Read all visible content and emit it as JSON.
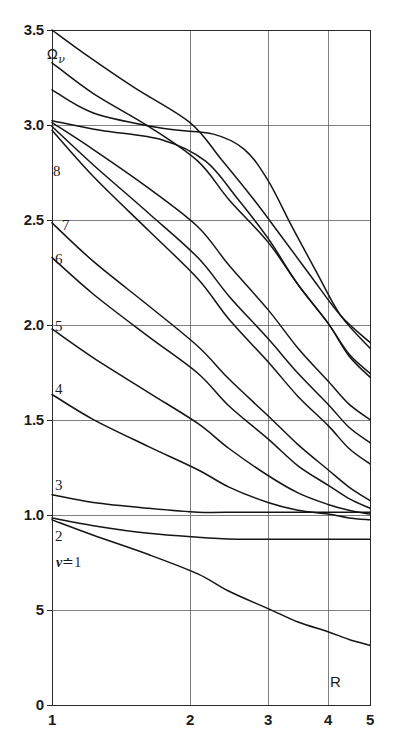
{
  "figure": {
    "name": "omega-nu-vs-R-chart",
    "background": "#ffffff",
    "ink_color": "#1a1a1a"
  },
  "chart_data": {
    "type": "line",
    "title": "",
    "subtitle": "",
    "xlabel": "R",
    "ylabel": "Ων",
    "xlim": [
      1,
      5
    ],
    "ylim": [
      0,
      3.5
    ],
    "grid": true,
    "grid_style": "solid thin rules at labeled ticks",
    "legend": "inline curve labels at left edge",
    "legend_position": "inline-left",
    "x_axis_scale": "nonlinear (compressed toward large R)",
    "x_ticks": [
      1,
      2,
      3,
      4,
      5
    ],
    "x_tick_labels": [
      "1",
      "2",
      "3",
      "4",
      "5"
    ],
    "x_tick_px": [
      52,
      190,
      268,
      328,
      370
    ],
    "y_ticks": [
      0,
      0.5,
      1.0,
      1.5,
      2.0,
      2.5,
      3.0,
      3.5
    ],
    "y_tick_labels": [
      "0",
      "5",
      "1.0",
      "1.5",
      "2.0",
      "2.5",
      "3.0",
      "3.5"
    ],
    "y_tick_px": [
      705,
      610,
      515,
      420,
      325,
      220,
      125,
      30
    ],
    "annotations": [
      {
        "text": "Ων",
        "x_px": 47,
        "y_px": 55,
        "kind": "y-axis-symbol"
      },
      {
        "text": "R",
        "x_px": 330,
        "y_px": 682,
        "kind": "x-axis-symbol"
      }
    ],
    "series": [
      {
        "name": "nu = 1",
        "label": "ν ≐ 1",
        "label_x_px": 57,
        "label_y_px": 564,
        "points": [
          [
            1,
            0.96
          ],
          [
            1.3,
            0.88
          ],
          [
            1.7,
            0.78
          ],
          [
            2.1,
            0.68
          ],
          [
            2.5,
            0.59
          ],
          [
            3.0,
            0.5
          ],
          [
            3.5,
            0.43
          ],
          [
            4.0,
            0.38
          ],
          [
            4.5,
            0.34
          ],
          [
            5.0,
            0.31
          ]
        ]
      },
      {
        "name": "nu = 2",
        "label": "2",
        "label_x_px": 57,
        "label_y_px": 537,
        "points": [
          [
            1,
            0.97
          ],
          [
            1.3,
            0.93
          ],
          [
            1.7,
            0.89
          ],
          [
            2.1,
            0.87
          ],
          [
            2.6,
            0.86
          ],
          [
            3.0,
            0.86
          ],
          [
            3.5,
            0.86
          ],
          [
            4.0,
            0.86
          ],
          [
            4.5,
            0.86
          ],
          [
            5.0,
            0.86
          ]
        ]
      },
      {
        "name": "nu = 3",
        "label": "3",
        "label_x_px": 57,
        "label_y_px": 486,
        "points": [
          [
            1,
            1.09
          ],
          [
            1.3,
            1.05
          ],
          [
            1.7,
            1.02
          ],
          [
            2.1,
            1.0
          ],
          [
            2.6,
            1.0
          ],
          [
            3.0,
            1.0
          ],
          [
            3.5,
            1.0
          ],
          [
            4.0,
            1.0
          ],
          [
            4.5,
            1.0
          ],
          [
            5.0,
            1.0
          ]
        ]
      },
      {
        "name": "nu = 4",
        "label": "4",
        "label_x_px": 57,
        "label_y_px": 390,
        "points": [
          [
            1,
            1.61
          ],
          [
            1.3,
            1.48
          ],
          [
            1.7,
            1.34
          ],
          [
            2.1,
            1.22
          ],
          [
            2.5,
            1.13
          ],
          [
            3.0,
            1.05
          ],
          [
            3.5,
            1.01
          ],
          [
            4.0,
            0.99
          ],
          [
            4.5,
            0.97
          ],
          [
            5.0,
            0.96
          ]
        ]
      },
      {
        "name": "nu = 5",
        "label": "5",
        "label_x_px": 57,
        "label_y_px": 327,
        "points": [
          [
            1,
            1.95
          ],
          [
            1.3,
            1.8
          ],
          [
            1.7,
            1.62
          ],
          [
            2.1,
            1.46
          ],
          [
            2.5,
            1.33
          ],
          [
            3.0,
            1.19
          ],
          [
            3.5,
            1.1
          ],
          [
            4.0,
            1.04
          ],
          [
            4.5,
            1.01
          ],
          [
            5.0,
            0.99
          ]
        ]
      },
      {
        "name": "nu = 6",
        "label": "6",
        "label_x_px": 57,
        "label_y_px": 260,
        "points": [
          [
            1,
            2.32
          ],
          [
            1.3,
            2.13
          ],
          [
            1.7,
            1.91
          ],
          [
            2.1,
            1.72
          ],
          [
            2.5,
            1.55
          ],
          [
            3.0,
            1.38
          ],
          [
            3.5,
            1.24
          ],
          [
            4.0,
            1.14
          ],
          [
            4.5,
            1.07
          ],
          [
            5.0,
            1.02
          ]
        ]
      },
      {
        "name": "nu = 7",
        "label": "7",
        "label_x_px": 62,
        "label_y_px": 226,
        "points": [
          [
            1,
            2.5
          ],
          [
            1.3,
            2.3
          ],
          [
            1.7,
            2.07
          ],
          [
            2.1,
            1.86
          ],
          [
            2.5,
            1.69
          ],
          [
            3.0,
            1.5
          ],
          [
            3.5,
            1.35
          ],
          [
            4.0,
            1.22
          ],
          [
            4.5,
            1.13
          ],
          [
            5.0,
            1.06
          ]
        ]
      },
      {
        "name": "nu = 8",
        "label": "8",
        "label_x_px": 57,
        "label_y_px": 172,
        "points": [
          [
            1,
            2.98
          ],
          [
            1.3,
            2.74
          ],
          [
            1.7,
            2.46
          ],
          [
            2.1,
            2.21
          ],
          [
            2.5,
            2.0
          ],
          [
            3.0,
            1.78
          ],
          [
            3.5,
            1.6
          ],
          [
            4.0,
            1.45
          ],
          [
            4.5,
            1.33
          ],
          [
            5.0,
            1.25
          ]
        ]
      },
      {
        "name": "nu = 9",
        "label": "",
        "points": [
          [
            1,
            3.0
          ],
          [
            1.3,
            2.8
          ],
          [
            1.7,
            2.55
          ],
          [
            2.1,
            2.32
          ],
          [
            2.5,
            2.12
          ],
          [
            3.0,
            1.9
          ],
          [
            3.5,
            1.72
          ],
          [
            4.0,
            1.56
          ],
          [
            4.5,
            1.44
          ],
          [
            5.0,
            1.36
          ]
        ]
      },
      {
        "name": "nu = 10",
        "label": "",
        "points": [
          [
            1,
            3.02
          ],
          [
            1.3,
            2.88
          ],
          [
            1.7,
            2.68
          ],
          [
            2.1,
            2.48
          ],
          [
            2.5,
            2.28
          ],
          [
            3.0,
            2.05
          ],
          [
            3.5,
            1.85
          ],
          [
            4.0,
            1.68
          ],
          [
            4.5,
            1.56
          ],
          [
            5.0,
            1.48
          ]
        ]
      },
      {
        "name": "nu = 11",
        "label": "",
        "points": [
          [
            1,
            3.03
          ],
          [
            1.35,
            2.98
          ],
          [
            1.8,
            2.93
          ],
          [
            2.2,
            2.82
          ],
          [
            2.6,
            2.63
          ],
          [
            3.0,
            2.42
          ],
          [
            3.5,
            2.18
          ],
          [
            4.0,
            1.98
          ],
          [
            4.5,
            1.82
          ],
          [
            5.0,
            1.72
          ]
        ]
      },
      {
        "name": "nu = 12",
        "label": "",
        "points": [
          [
            1,
            3.19
          ],
          [
            1.3,
            3.07
          ],
          [
            1.8,
            2.99
          ],
          [
            2.3,
            2.96
          ],
          [
            2.7,
            2.88
          ],
          [
            3.0,
            2.72
          ],
          [
            3.4,
            2.48
          ],
          [
            3.8,
            2.25
          ],
          [
            4.3,
            2.02
          ],
          [
            5.0,
            1.85
          ]
        ]
      },
      {
        "name": "nu = 13",
        "label": "",
        "points": [
          [
            1,
            3.33
          ],
          [
            1.3,
            3.17
          ],
          [
            1.7,
            3.0
          ],
          [
            2.1,
            2.82
          ],
          [
            2.5,
            2.62
          ],
          [
            3.0,
            2.4
          ],
          [
            3.5,
            2.18
          ],
          [
            4.0,
            1.98
          ],
          [
            4.5,
            1.81
          ],
          [
            5.0,
            1.7
          ]
        ]
      },
      {
        "name": "nu = 14",
        "label": "",
        "points": [
          [
            1,
            3.5
          ],
          [
            1.25,
            3.37
          ],
          [
            1.6,
            3.2
          ],
          [
            2.0,
            3.02
          ],
          [
            2.4,
            2.83
          ],
          [
            2.8,
            2.63
          ],
          [
            3.2,
            2.44
          ],
          [
            3.7,
            2.23
          ],
          [
            4.3,
            2.02
          ],
          [
            5.0,
            1.88
          ]
        ]
      }
    ]
  },
  "axes": {
    "y_labels": [
      {
        "text": "3.5",
        "y_px": 30
      },
      {
        "text": "3.0",
        "y_px": 125
      },
      {
        "text": "2.5",
        "y_px": 220
      },
      {
        "text": "2.0",
        "y_px": 325
      },
      {
        "text": "1.5",
        "y_px": 420
      },
      {
        "text": "1.0",
        "y_px": 515
      },
      {
        "text": "5",
        "y_px": 610
      },
      {
        "text": "0",
        "y_px": 705
      }
    ],
    "x_labels": [
      {
        "text": "1",
        "x_px": 52
      },
      {
        "text": "2",
        "x_px": 190
      },
      {
        "text": "3",
        "x_px": 268
      },
      {
        "text": "4",
        "x_px": 328
      },
      {
        "text": "5",
        "x_px": 370
      }
    ],
    "y_symbol": "Ω",
    "y_symbol_subscript": "ν",
    "x_symbol": "R"
  },
  "curve_labels": [
    {
      "id": "label-nu-8",
      "text": "8",
      "x_px": 53,
      "y_px": 172
    },
    {
      "id": "label-nu-7",
      "text": "7",
      "x_px": 62,
      "y_px": 226
    },
    {
      "id": "label-nu-6",
      "text": "6",
      "x_px": 55,
      "y_px": 260
    },
    {
      "id": "label-nu-5",
      "text": "5",
      "x_px": 55,
      "y_px": 327
    },
    {
      "id": "label-nu-4",
      "text": "4",
      "x_px": 55,
      "y_px": 390
    },
    {
      "id": "label-nu-3",
      "text": "3",
      "x_px": 55,
      "y_px": 486
    },
    {
      "id": "label-nu-2",
      "text": "2",
      "x_px": 55,
      "y_px": 537
    }
  ],
  "nu_equals_one": {
    "nu": "ν",
    "relation": "≐",
    "value": "1",
    "x_px": 56,
    "y_px": 563
  }
}
